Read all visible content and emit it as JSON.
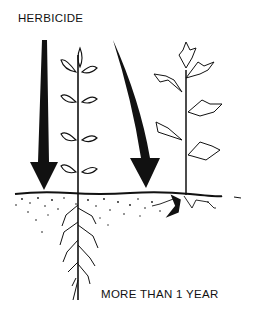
{
  "diagram": {
    "title_label": "HERBICIDE",
    "caption": "MORE THAN  1  YEAR",
    "elements": [
      {
        "name": "straight-arrow",
        "description": "herbicide arrow pointing down to soil beside young plant"
      },
      {
        "name": "young-plant",
        "description": "seedling with oval leaves and deep taproot system"
      },
      {
        "name": "curved-arrow",
        "description": "herbicide arrow curving down to soil beside older plant"
      },
      {
        "name": "older-plant",
        "description": "plant with lobed leaves and shallow root crown"
      },
      {
        "name": "soil",
        "description": "stippled soil surface layer"
      }
    ],
    "colors": {
      "ink": "#111111",
      "background": "#ffffff"
    }
  }
}
